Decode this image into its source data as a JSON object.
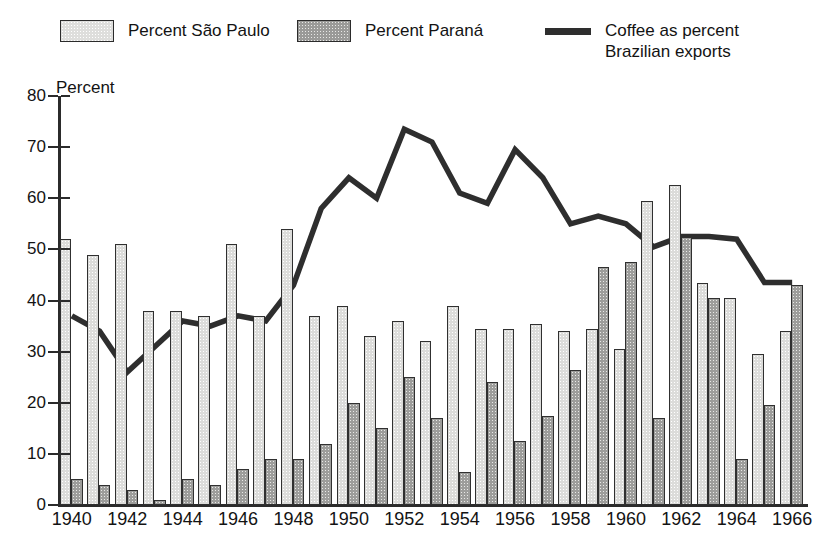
{
  "legend": {
    "items": [
      {
        "name": "sao-paulo",
        "label": "Percent São Paulo",
        "swatch": "light-hatched-square",
        "color": "#dcdcda"
      },
      {
        "name": "parana",
        "label": "Percent Paraná",
        "swatch": "dark-hatched-square",
        "color": "#9d9d9b"
      },
      {
        "name": "coffee-exports",
        "label": "Coffee as percent\nBrazilian exports",
        "swatch": "thick-line",
        "color": "#2e2e2e"
      }
    ]
  },
  "axes": {
    "y_title": "Percent",
    "y_ticks": [
      "0",
      "10",
      "20",
      "30",
      "40",
      "50",
      "60",
      "70",
      "80"
    ],
    "x_ticks": [
      "1940",
      "1942",
      "1944",
      "1946",
      "1948",
      "1950",
      "1952",
      "1954",
      "1956",
      "1958",
      "1960",
      "1962",
      "1964",
      "1966"
    ]
  },
  "chart_data": {
    "type": "bar",
    "title": "",
    "subtitle": "",
    "xlabel": "",
    "ylabel": "Percent",
    "ylim": [
      0,
      80
    ],
    "xlim": [
      1940,
      1966
    ],
    "grid": false,
    "legend_position": "top",
    "categories": [
      1940,
      1941,
      1942,
      1943,
      1944,
      1945,
      1946,
      1947,
      1948,
      1949,
      1950,
      1951,
      1952,
      1953,
      1954,
      1955,
      1956,
      1957,
      1958,
      1959,
      1960,
      1961,
      1962,
      1963,
      1964,
      1965,
      1966
    ],
    "series": [
      {
        "name": "Percent São Paulo",
        "type": "bar",
        "color": "#dcdcda",
        "values": [
          52,
          49,
          51,
          38,
          38,
          37,
          51,
          37,
          54,
          37,
          39,
          33,
          36,
          32,
          39,
          34.5,
          34.5,
          35.5,
          34,
          34.5,
          30.5,
          59.5,
          62.5,
          43.5,
          40.5,
          29.5,
          34
        ]
      },
      {
        "name": "Percent Paraná",
        "type": "bar",
        "color": "#9d9d9b",
        "values": [
          5,
          4,
          3,
          1,
          5,
          4,
          7,
          9,
          9,
          12,
          20,
          15,
          25,
          17,
          6.5,
          24,
          12.5,
          17.5,
          26.5,
          46.5,
          47.5,
          17,
          52.5,
          40.5,
          9,
          19.5,
          43
        ]
      },
      {
        "name": "Coffee as percent Brazilian exports",
        "type": "line",
        "color": "#2e2e2e",
        "values": [
          37,
          34,
          26,
          31,
          36,
          35,
          37,
          36,
          43,
          58,
          64,
          60,
          73.5,
          71,
          61,
          59,
          69.5,
          64,
          55,
          56.5,
          55,
          50.5,
          52.5,
          52.5,
          52,
          43.5,
          43.5
        ]
      }
    ]
  }
}
